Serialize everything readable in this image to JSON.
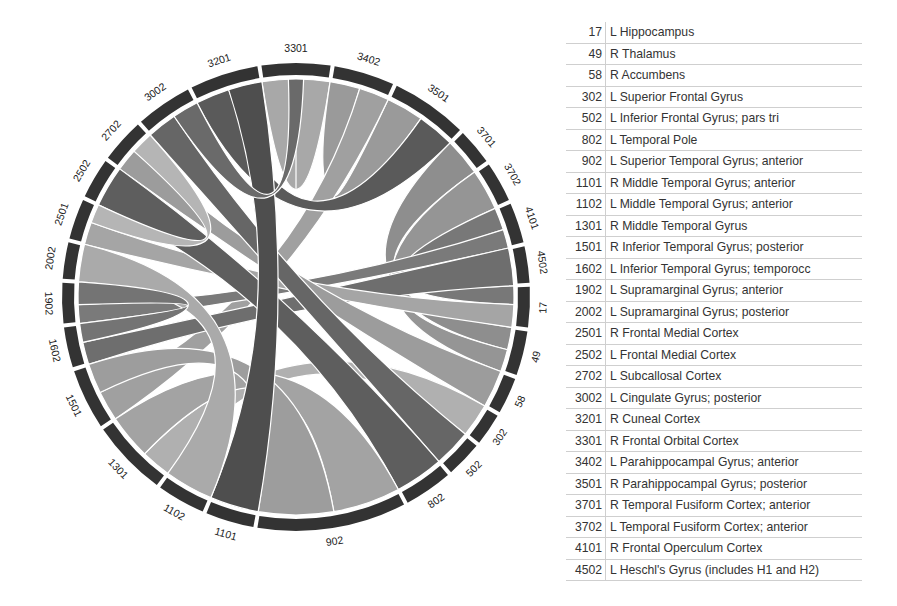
{
  "chart_data": {
    "type": "chord",
    "title": "",
    "segments_clockwise_from_top": [
      {
        "code": "3301",
        "start": -9,
        "end": 9
      },
      {
        "code": "3402",
        "start": 9,
        "end": 25
      },
      {
        "code": "3501",
        "start": 25,
        "end": 45
      },
      {
        "code": "3701",
        "start": 45,
        "end": 55
      },
      {
        "code": "3702",
        "start": 55,
        "end": 66
      },
      {
        "code": "4101",
        "start": 66,
        "end": 77
      },
      {
        "code": "4502",
        "start": 77,
        "end": 87
      },
      {
        "code": "17",
        "start": 87,
        "end": 98
      },
      {
        "code": "49",
        "start": 98,
        "end": 110
      },
      {
        "code": "58",
        "start": 110,
        "end": 120
      },
      {
        "code": "302",
        "start": 120,
        "end": 129
      },
      {
        "code": "502",
        "start": 129,
        "end": 139
      },
      {
        "code": "802",
        "start": 139,
        "end": 152
      },
      {
        "code": "902",
        "start": 152,
        "end": 190
      },
      {
        "code": "1101",
        "start": 190,
        "end": 203
      },
      {
        "code": "1102",
        "start": 203,
        "end": 216
      },
      {
        "code": "1301",
        "start": 216,
        "end": 236
      },
      {
        "code": "1501",
        "start": 236,
        "end": 252
      },
      {
        "code": "1602",
        "start": 252,
        "end": 263
      },
      {
        "code": "1902",
        "start": 263,
        "end": 274
      },
      {
        "code": "2002",
        "start": 274,
        "end": 284
      },
      {
        "code": "2501",
        "start": 284,
        "end": 295
      },
      {
        "code": "2502",
        "start": 295,
        "end": 306
      },
      {
        "code": "2702",
        "start": 306,
        "end": 318
      },
      {
        "code": "3002",
        "start": 318,
        "end": 333
      },
      {
        "code": "3201",
        "start": 333,
        "end": 351
      }
    ],
    "ribbons": [
      {
        "a": [
          -9,
          0
        ],
        "b": [
          0,
          9
        ],
        "shade": "#a8a8a8"
      },
      {
        "a": [
          9,
          17
        ],
        "b": [
          25,
          35
        ],
        "shade": "#9a9a9a"
      },
      {
        "a": [
          17,
          25
        ],
        "b": [
          236,
          244
        ],
        "shade": "#a0a0a0"
      },
      {
        "a": [
          35,
          45
        ],
        "b": [
          333,
          342
        ],
        "shade": "#5a5a5a"
      },
      {
        "a": [
          45,
          55
        ],
        "b": [
          98,
          104
        ],
        "shade": "#8e8e8e"
      },
      {
        "a": [
          55,
          66
        ],
        "b": [
          104,
          110
        ],
        "shade": "#959595"
      },
      {
        "a": [
          66,
          72
        ],
        "b": [
          87,
          92
        ],
        "shade": "#787878"
      },
      {
        "a": [
          72,
          77
        ],
        "b": [
          263,
          268
        ],
        "shade": "#7a7a7a"
      },
      {
        "a": [
          77,
          87
        ],
        "b": [
          252,
          258
        ],
        "shade": "#6e6e6e"
      },
      {
        "a": [
          92,
          98
        ],
        "b": [
          284,
          290
        ],
        "shade": "#a5a5a5"
      },
      {
        "a": [
          110,
          120
        ],
        "b": [
          306,
          312
        ],
        "shade": "#9c9c9c"
      },
      {
        "a": [
          120,
          129
        ],
        "b": [
          216,
          224
        ],
        "shade": "#b0b0b0"
      },
      {
        "a": [
          129,
          139
        ],
        "b": [
          318,
          326
        ],
        "shade": "#666666"
      },
      {
        "a": [
          139,
          152
        ],
        "b": [
          295,
          306
        ],
        "shade": "#5e5e5e"
      },
      {
        "a": [
          152,
          170
        ],
        "b": [
          224,
          236
        ],
        "shade": "#a3a3a3"
      },
      {
        "a": [
          170,
          190
        ],
        "b": [
          244,
          252
        ],
        "shade": "#9d9d9d"
      },
      {
        "a": [
          190,
          203
        ],
        "b": [
          342,
          351
        ],
        "shade": "#4e4e4e"
      },
      {
        "a": [
          203,
          216
        ],
        "b": [
          274,
          284
        ],
        "shade": "#aaaaaa"
      },
      {
        "a": [
          258,
          263
        ],
        "b": [
          268,
          274
        ],
        "shade": "#747474"
      },
      {
        "a": [
          290,
          295
        ],
        "b": [
          312,
          318
        ],
        "shade": "#b5b5b5"
      },
      {
        "a": [
          326,
          333
        ],
        "b": [
          0,
          0
        ],
        "shade": "#6a6a6a"
      }
    ],
    "center": [
      296,
      297
    ],
    "outer_radius": 234,
    "ring_thickness": 12
  },
  "legend": [
    {
      "code": "17",
      "name": "L Hippocampus"
    },
    {
      "code": "49",
      "name": "R Thalamus"
    },
    {
      "code": "58",
      "name": "R Accumbens"
    },
    {
      "code": "302",
      "name": "L Superior Frontal Gyrus"
    },
    {
      "code": "502",
      "name": "L Inferior Frontal Gyrus; pars tri"
    },
    {
      "code": "802",
      "name": "L Temporal Pole"
    },
    {
      "code": "902",
      "name": "L Superior Temporal Gyrus; anterior"
    },
    {
      "code": "1101",
      "name": "R Middle Temporal Gyrus; anterior"
    },
    {
      "code": "1102",
      "name": "L Middle Temporal Gyrus; anterior"
    },
    {
      "code": "1301",
      "name": "R Middle Temporal Gyrus"
    },
    {
      "code": "1501",
      "name": "R Inferior Temporal Gyrus; posterior"
    },
    {
      "code": "1602",
      "name": "L Inferior Temporal Gyrus; temporocc"
    },
    {
      "code": "1902",
      "name": "L Supramarginal Gyrus; anterior"
    },
    {
      "code": "2002",
      "name": "L Supramarginal Gyrus; posterior"
    },
    {
      "code": "2501",
      "name": "R Frontal Medial Cortex"
    },
    {
      "code": "2502",
      "name": "L Frontal Medial Cortex"
    },
    {
      "code": "2702",
      "name": "L Subcallosal Cortex"
    },
    {
      "code": "3002",
      "name": "L Cingulate Gyrus; posterior"
    },
    {
      "code": "3201",
      "name": "R Cuneal Cortex"
    },
    {
      "code": "3301",
      "name": "R Frontal Orbital Cortex"
    },
    {
      "code": "3402",
      "name": "L Parahippocampal Gyrus; anterior"
    },
    {
      "code": "3501",
      "name": "R Parahippocampal Gyrus; posterior"
    },
    {
      "code": "3701",
      "name": "R Temporal Fusiform Cortex; anterior"
    },
    {
      "code": "3702",
      "name": "L Temporal Fusiform Cortex; anterior"
    },
    {
      "code": "4101",
      "name": "R Frontal Operculum Cortex"
    },
    {
      "code": "4502",
      "name": "L Heschl's Gyrus (includes H1 and H2)"
    }
  ],
  "colors": {
    "ring": "#333333",
    "separator": "#ffffff"
  }
}
